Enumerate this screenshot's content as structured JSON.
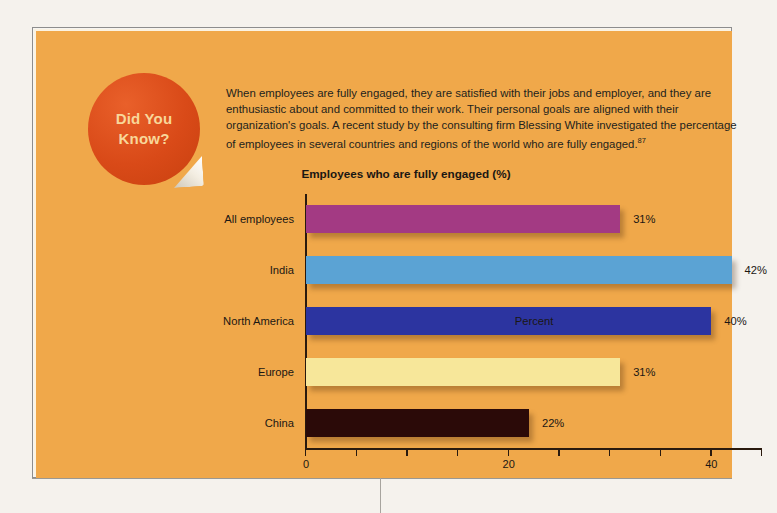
{
  "badge": {
    "line1": "Did You",
    "line2": "Know?"
  },
  "intro": {
    "text": "When employees are fully engaged, they are satisfied with their jobs and employer, and they are enthusiastic about and committed to their work. Their personal goals are aligned with their organization's goals. A recent study by the consulting firm Blessing White investigated the percentage of employees in several countries and regions of the world who are fully engaged.",
    "footnote": "87"
  },
  "colors": {
    "panel_background": "#f0a84a",
    "page_background": "#f5f2ed",
    "badge": "#d94a18",
    "badge_text": "#f8d79a",
    "text": "#1b1713",
    "axis": "#2a1a0e"
  },
  "chart_data": {
    "type": "bar",
    "orientation": "horizontal",
    "title": "Employees who are fully engaged (%)",
    "xlabel": "Percent",
    "ylabel": "",
    "categories": [
      "All employees",
      "India",
      "North America",
      "Europe",
      "China"
    ],
    "values": [
      31,
      42,
      40,
      31,
      22
    ],
    "value_labels": [
      "31%",
      "42%",
      "40%",
      "31%",
      "22%"
    ],
    "bar_colors": [
      "#a33a83",
      "#5ba3d4",
      "#2c34a0",
      "#f7e79a",
      "#2b0a08"
    ],
    "xlim": [
      0,
      45
    ],
    "xticks": [
      0,
      5,
      10,
      15,
      20,
      25,
      30,
      35,
      40,
      45
    ],
    "xtick_labels": {
      "0": "0",
      "20": "20",
      "40": "40"
    },
    "grid": false,
    "legend": false
  }
}
